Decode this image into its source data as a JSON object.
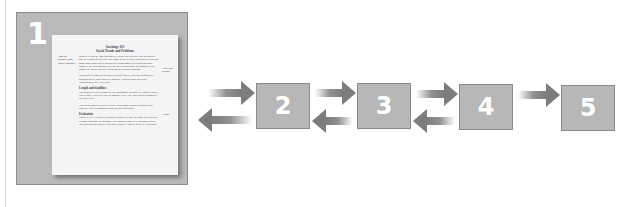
{
  "diagram": {
    "steps": [
      {
        "label": "1"
      },
      {
        "label": "2"
      },
      {
        "label": "3"
      },
      {
        "label": "4"
      },
      {
        "label": "5"
      }
    ],
    "connections": [
      {
        "from": "1",
        "to": "2",
        "direction": "forward"
      },
      {
        "from": "2",
        "to": "1",
        "direction": "back"
      },
      {
        "from": "2",
        "to": "3",
        "direction": "forward"
      },
      {
        "from": "3",
        "to": "2",
        "direction": "back"
      },
      {
        "from": "3",
        "to": "4",
        "direction": "forward"
      },
      {
        "from": "4",
        "to": "3",
        "direction": "back"
      },
      {
        "from": "4",
        "to": "5",
        "direction": "forward"
      }
    ],
    "colors": {
      "box_fill": "#b7b7b7",
      "box_border": "#8a8a8a",
      "arrow": "#7d7d7d",
      "number": "#ffffff"
    }
  },
  "document": {
    "title_line1": "Sociology 101",
    "title_line2": "Social Trends and Problems",
    "left_note": "Look for purpose, topic, length, audience",
    "right_note_a": "Topic and purpose",
    "right_note_b": "Length",
    "paragraphs": [
      "Identify a trend in American society culture that interests you and analyze one of its consequences for you. Some topics we have discussed in class that might make good papers include the rising number of second-marriage families, the widening gap between the rich and poor, and changes in the number of people who are living together without marriage.",
      "You should attempt to find solid facts and figures, and find authoritative opinions on the topic wherever possible. Consider how particular consequences affect the trend.",
      "Length and deadlines",
      "You should be able to complete this assignment in about five double-spaced, typed pages. Papers are due on Monday (Sept. 30); your thesis statement is due next week.",
      "Your ideas should be stated clearly, with a good balance of sources and analysis. This is an important part of your final grade.",
      "Evaluation",
      "Papers will be evaluated according to how well they use logic and evidence to show causation. In addition, I will consider how well you contextualize your analysis for readers. Why does it matter? Who is affected? And so on."
    ]
  }
}
